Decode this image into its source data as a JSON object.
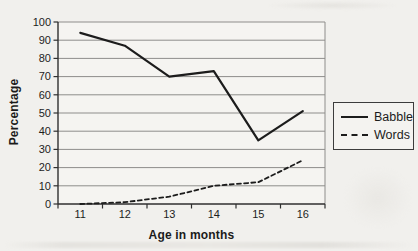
{
  "figure": {
    "background": "#f1f0ed",
    "plot_background": "#f5f4f1",
    "axis_color": "#2f2f2f",
    "grid_color": "#8e8d8b",
    "line_color": "#1c1c1c",
    "text_color": "#1d1d1d"
  },
  "chart_data": {
    "type": "line",
    "title": "",
    "xlabel": "Age in months",
    "ylabel": "Percentage",
    "categories": [
      "11",
      "12",
      "13",
      "14",
      "15",
      "16"
    ],
    "series": [
      {
        "name": "Babble",
        "style": "solid",
        "values": [
          94,
          87,
          70,
          73,
          35,
          51
        ]
      },
      {
        "name": "Words",
        "style": "dashed",
        "values": [
          0,
          1,
          4,
          10,
          12,
          24
        ]
      }
    ],
    "ylim": [
      0,
      100
    ],
    "yticks": [
      0,
      10,
      20,
      30,
      40,
      50,
      60,
      70,
      80,
      90,
      100
    ],
    "ytick_step": 10,
    "grid": "horizontal",
    "legend_position": "right",
    "legend_labels": [
      "Babble",
      "Words"
    ]
  }
}
